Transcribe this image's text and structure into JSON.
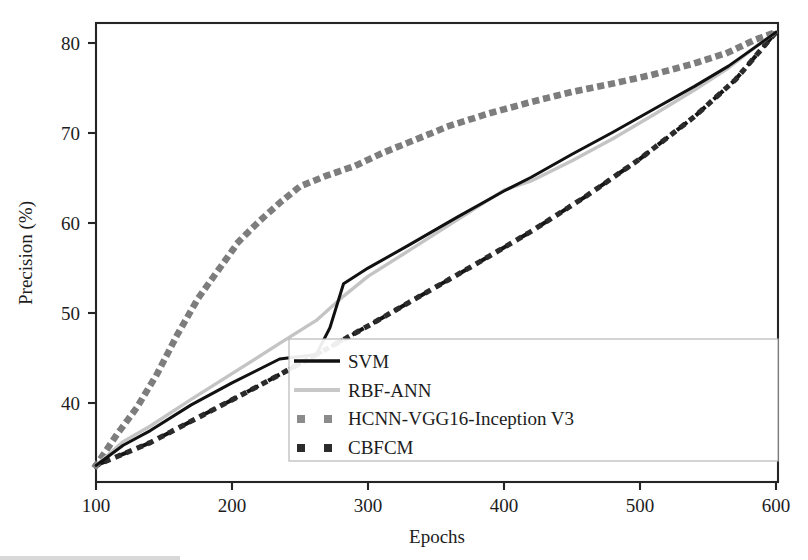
{
  "chart_data": {
    "type": "line",
    "title": "",
    "xlabel": "Epochs",
    "ylabel": "Precision (%)",
    "xlim": [
      100,
      600
    ],
    "ylim": [
      31.2,
      81.2
    ],
    "xticks": [
      100,
      200,
      300,
      400,
      500,
      600
    ],
    "yticks": [
      40,
      50,
      60,
      70,
      80
    ],
    "xtick_labels": [
      "100",
      "200",
      "300",
      "400",
      "500",
      "600"
    ],
    "ytick_labels": [
      "40",
      "50",
      "60",
      "70",
      "80"
    ],
    "grid": false,
    "legend_position": "bottom-right",
    "series": [
      {
        "name": "SVM",
        "style": "solid",
        "color": "#111111",
        "x": [
          100,
          120,
          140,
          170,
          200,
          235,
          262,
          272,
          282,
          300,
          330,
          365,
          400,
          420,
          450,
          480,
          510,
          540,
          565,
          585,
          600
        ],
        "values": [
          33.0,
          35.2,
          36.8,
          39.6,
          42.0,
          44.6,
          45.1,
          48.0,
          52.8,
          54.5,
          57.0,
          60.0,
          62.9,
          64.4,
          66.9,
          69.3,
          71.8,
          74.3,
          76.5,
          78.6,
          80.2
        ]
      },
      {
        "name": "RBF-ANN",
        "style": "solid",
        "color": "#c4c4c4",
        "x": [
          100,
          120,
          140,
          170,
          200,
          235,
          262,
          280,
          300,
          330,
          365,
          400,
          420,
          450,
          480,
          510,
          540,
          565,
          585,
          600
        ],
        "values": [
          33.0,
          35.6,
          37.3,
          40.2,
          43.0,
          46.3,
          48.8,
          51.2,
          53.6,
          56.4,
          59.7,
          63.0,
          64.0,
          66.2,
          68.6,
          71.2,
          73.9,
          76.3,
          78.6,
          80.2
        ]
      },
      {
        "name": "HCNN-VGG16-Inception V3",
        "style": "dotted",
        "color": "#7d7d7d",
        "x": [
          100,
          115,
          130,
          145,
          160,
          175,
          190,
          205,
          220,
          235,
          250,
          270,
          290,
          310,
          330,
          360,
          390,
          420,
          450,
          480,
          510,
          540,
          565,
          585,
          600
        ],
        "values": [
          33.0,
          36.3,
          39.3,
          43.0,
          47.3,
          51.2,
          54.3,
          57.4,
          59.6,
          61.6,
          63.4,
          64.6,
          65.6,
          67.0,
          68.2,
          70.0,
          71.4,
          72.6,
          73.7,
          74.6,
          75.6,
          76.8,
          78.0,
          79.4,
          80.2
        ]
      },
      {
        "name": "CBFCM",
        "style": "dashed",
        "color": "#151515",
        "x": [
          100,
          140,
          180,
          220,
          260,
          300,
          340,
          380,
          420,
          460,
          500,
          540,
          570,
          600
        ],
        "values": [
          33.0,
          35.5,
          38.6,
          41.7,
          44.9,
          48.2,
          51.6,
          55.0,
          58.5,
          62.3,
          66.4,
          71.0,
          75.0,
          80.2
        ]
      }
    ]
  },
  "axes": {
    "x_title": "Epochs",
    "y_title": "Precision (%)",
    "x_ticks": [
      "100",
      "200",
      "300",
      "400",
      "500",
      "600"
    ],
    "y_ticks": [
      "40",
      "50",
      "60",
      "70",
      "80"
    ]
  },
  "legend": {
    "entries": [
      {
        "label": "SVM",
        "marker": "solid-line",
        "color": "#111111"
      },
      {
        "label": "RBF-ANN",
        "marker": "solid-line",
        "color": "#c4c4c4"
      },
      {
        "label": "HCNN-VGG16-Inception V3",
        "marker": "square-dots",
        "color": "#7d7d7d"
      },
      {
        "label": "CBFCM",
        "marker": "square-dots",
        "color": "#2b2b2b"
      }
    ]
  },
  "colors": {
    "svm": "#111111",
    "rbf_ann": "#c4c4c4",
    "hcnn": "#7d7d7d",
    "cbfcm": "#151515",
    "axis": "#252525",
    "background": "#ffffff"
  }
}
